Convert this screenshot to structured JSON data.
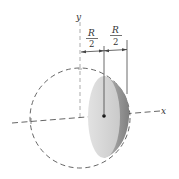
{
  "diagram": {
    "axes": {
      "x_label": "x",
      "y_label": "y"
    },
    "dimensions": [
      {
        "numerator": "R",
        "denominator": "2"
      },
      {
        "numerator": "R",
        "denominator": "2"
      }
    ],
    "colors": {
      "solid_light": "#d4d4d4",
      "solid_dark": "#8a8a8a",
      "dashed": "#555555",
      "axis": "#777777",
      "text": "#333333"
    }
  }
}
